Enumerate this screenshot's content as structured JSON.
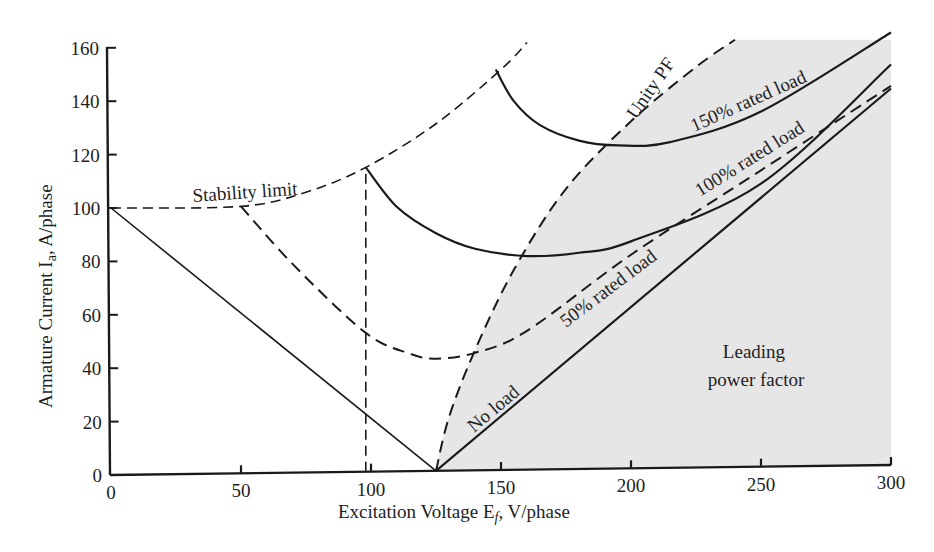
{
  "chart_data": {
    "type": "line",
    "title": "",
    "xlabel": "Excitation Voltage E_f, V/phase",
    "ylabel": "Armature Current I_a, A/phase",
    "xlim": [
      0,
      300
    ],
    "ylim": [
      0,
      160
    ],
    "x_ticks": [
      0,
      50,
      100,
      150,
      200,
      250,
      300
    ],
    "y_ticks": [
      0,
      20,
      40,
      60,
      80,
      100,
      120,
      140,
      160
    ],
    "grid": false,
    "legend": "none (inline labels)",
    "shaded_region": {
      "label": "Leading power factor",
      "color": "#e4e4e4",
      "bounded_by": "Unity PF curve (left) to plot right edge"
    },
    "series": [
      {
        "name": "No load",
        "style": "solid",
        "points": [
          [
            125,
            0
          ],
          [
            300,
            141
          ]
        ]
      },
      {
        "name": "Lagging no-load line",
        "style": "solid",
        "points": [
          [
            0,
            100
          ],
          [
            125,
            0
          ]
        ]
      },
      {
        "name": "50% rated load",
        "style": "dashed",
        "points": [
          [
            50,
            100
          ],
          [
            70,
            78
          ],
          [
            98,
            52
          ],
          [
            115,
            44
          ],
          [
            125,
            42
          ],
          [
            140,
            44
          ],
          [
            160,
            52
          ],
          [
            200,
            80
          ],
          [
            250,
            111
          ],
          [
            300,
            142
          ]
        ]
      },
      {
        "name": "100% rated load",
        "style": "solid",
        "points": [
          [
            98,
            114
          ],
          [
            110,
            99
          ],
          [
            125,
            89
          ],
          [
            140,
            83
          ],
          [
            160,
            80
          ],
          [
            180,
            81
          ],
          [
            200,
            85
          ],
          [
            250,
            106
          ],
          [
            300,
            150
          ]
        ]
      },
      {
        "name": "150% rated load",
        "style": "solid",
        "points": [
          [
            148,
            150
          ],
          [
            155,
            138
          ],
          [
            165,
            129
          ],
          [
            180,
            123
          ],
          [
            195,
            121
          ],
          [
            215,
            122
          ],
          [
            250,
            133
          ],
          [
            300,
            162
          ]
        ]
      },
      {
        "name": "Stability limit",
        "style": "dashed",
        "points": [
          [
            0,
            100
          ],
          [
            50,
            100
          ],
          [
            75,
            105
          ],
          [
            98,
            114
          ],
          [
            125,
            130
          ],
          [
            150,
            150
          ],
          [
            160,
            160
          ]
        ]
      },
      {
        "name": "Unity PF",
        "style": "dashed",
        "points": [
          [
            125,
            0
          ],
          [
            130,
            20
          ],
          [
            140,
            45
          ],
          [
            155,
            75
          ],
          [
            175,
            105
          ],
          [
            200,
            130
          ],
          [
            225,
            150
          ],
          [
            240,
            160
          ]
        ]
      },
      {
        "name": "Vertical reference",
        "style": "dashed",
        "points": [
          [
            98,
            0
          ],
          [
            98,
            114
          ]
        ]
      }
    ],
    "annotations": [
      "Stability limit",
      "Unity PF",
      "150% rated load",
      "100% rated load",
      "50% rated load",
      "No load",
      "Leading power factor"
    ]
  },
  "labels": {
    "xlabel_main": "Excitation Voltage E",
    "xlabel_sub": "f",
    "xlabel_tail": ", V/phase",
    "ylabel_main": "Armature Current I",
    "ylabel_sub": "a",
    "ylabel_tail": ", A/phase",
    "stability": "Stability limit",
    "unity": "Unity PF",
    "load150": "150% rated load",
    "load100": "100% rated load",
    "load50": "50% rated load",
    "noload": "No load",
    "leading1": "Leading",
    "leading2": "power factor"
  },
  "ticks": {
    "x": [
      "0",
      "50",
      "100",
      "150",
      "200",
      "250",
      "300"
    ],
    "y": [
      "0",
      "20",
      "40",
      "60",
      "80",
      "100",
      "120",
      "140",
      "160"
    ]
  }
}
